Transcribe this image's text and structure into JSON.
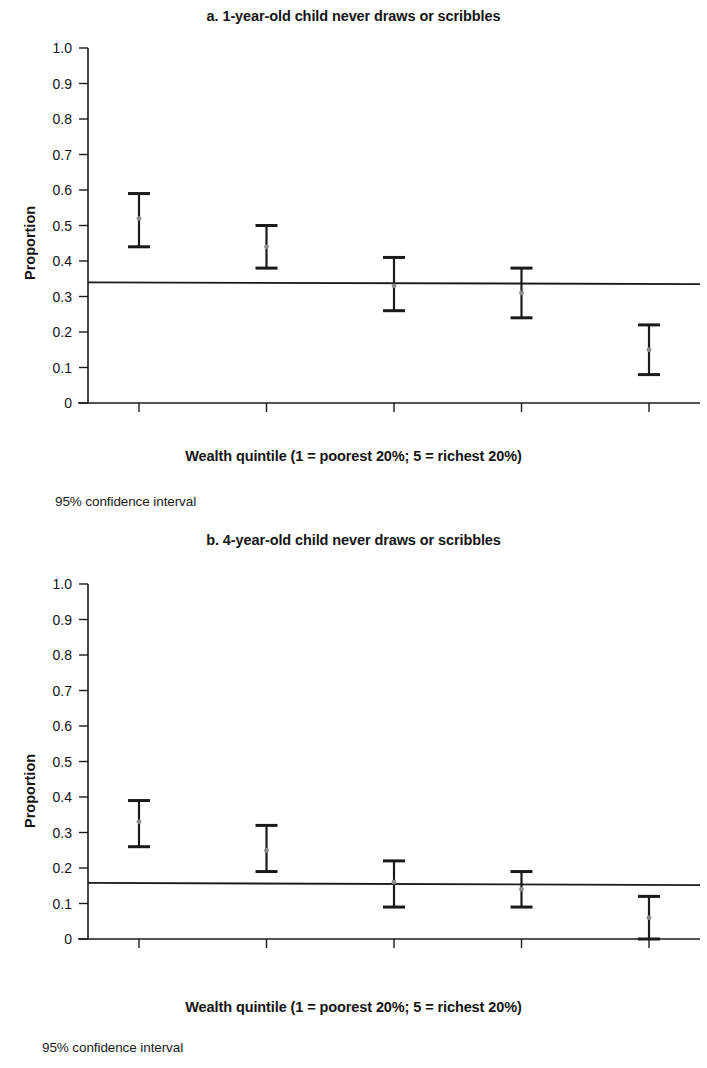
{
  "figure": {
    "y_axis_title": "Proportion",
    "x_axis_title": "Wealth quintile (1 = poorest 20%; 5 = richest 20%)",
    "footnote": "95% confidence interval",
    "y_tick_labels": [
      "1.0",
      "0.9",
      "0.8",
      "0.7",
      "0.6",
      "0.5",
      "0.4",
      "0.3",
      "0.2",
      "0.1",
      "0"
    ],
    "x_tick_labels": [
      "1",
      "2",
      "3",
      "4",
      "5"
    ],
    "line_color": "#1a1a1a",
    "marker_color": "#8c8c8c"
  },
  "panels": [
    {
      "id": "a",
      "title": "a. 1-year-old child never draws or scribbles"
    },
    {
      "id": "b",
      "title": "b. 4-year-old child never draws or scribbles"
    }
  ],
  "chart_data": [
    {
      "type": "scatter",
      "title": "a. 1-year-old child never draws or scribbles",
      "xlabel": "Wealth quintile (1 = poorest 20%; 5 = richest 20%)",
      "ylabel": "Proportion",
      "xlim": [
        0.6,
        5.4
      ],
      "ylim": [
        0,
        1.0
      ],
      "ytick_values": [
        0,
        0.1,
        0.2,
        0.3,
        0.4,
        0.5,
        0.6,
        0.7,
        0.8,
        0.9,
        1.0
      ],
      "grid": false,
      "legend": "95% confidence interval",
      "categories": [
        "1",
        "2",
        "3",
        "4",
        "5"
      ],
      "x": [
        1,
        2,
        3,
        4,
        5
      ],
      "values": [
        0.52,
        0.44,
        0.33,
        0.31,
        0.15
      ],
      "ci_lower": [
        0.44,
        0.38,
        0.26,
        0.24,
        0.08
      ],
      "ci_upper": [
        0.59,
        0.5,
        0.41,
        0.38,
        0.22
      ],
      "trend_line": {
        "y_start": 0.34,
        "y_end": 0.335
      }
    },
    {
      "type": "scatter",
      "title": "b. 4-year-old child never draws or scribbles",
      "xlabel": "Wealth quintile (1 = poorest 20%; 5 = richest 20%)",
      "ylabel": "Proportion",
      "xlim": [
        0.6,
        5.4
      ],
      "ylim": [
        0,
        1.0
      ],
      "ytick_values": [
        0,
        0.1,
        0.2,
        0.3,
        0.4,
        0.5,
        0.6,
        0.7,
        0.8,
        0.9,
        1.0
      ],
      "grid": false,
      "legend": "95% confidence interval",
      "categories": [
        "1",
        "2",
        "3",
        "4",
        "5"
      ],
      "x": [
        1,
        2,
        3,
        4,
        5
      ],
      "values": [
        0.33,
        0.25,
        0.16,
        0.14,
        0.06
      ],
      "ci_lower": [
        0.26,
        0.19,
        0.09,
        0.09,
        0.0
      ],
      "ci_upper": [
        0.39,
        0.32,
        0.22,
        0.19,
        0.12
      ],
      "trend_line": {
        "y_start": 0.158,
        "y_end": 0.152
      }
    }
  ]
}
